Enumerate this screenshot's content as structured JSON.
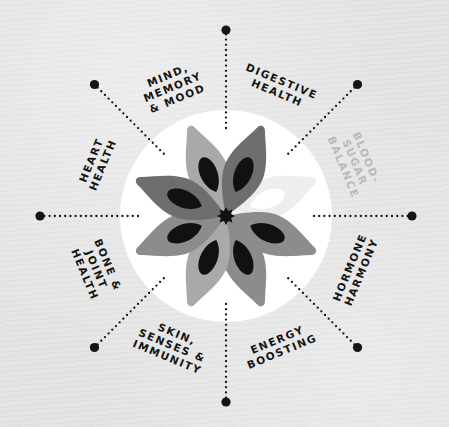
{
  "diagram": {
    "title": "",
    "center": {
      "x": 226,
      "y": 216
    },
    "circle_radius": 106,
    "colors": {
      "background": "#e4e4e4",
      "circle": "#ffffff",
      "ink": "#141414",
      "faded_label": "#b9b9b9",
      "petal_dark": "#6e6e6e",
      "petal_mid": "#8c8c8c",
      "petal_light": "#a9a9a9",
      "petal_faded": "#eeeeee",
      "seed": "#111111"
    },
    "spokes": [
      {
        "id": "mind-memory-mood",
        "angle": -135,
        "label_lines": [
          "MIND,",
          "MEMORY",
          "& MOOD"
        ],
        "faded": false
      },
      {
        "id": "digestive-health",
        "angle": -90,
        "label_lines": [
          "DIGESTIVE",
          "HEALTH"
        ],
        "faded": false
      },
      {
        "id": "blood-sugar-balance",
        "angle": -45,
        "label_lines": [
          "BLOOD-",
          "SUGAR",
          "BALANCE"
        ],
        "faded": true
      },
      {
        "id": "hormone-harmony",
        "angle": 0,
        "label_lines": [
          "HORMONE",
          "HARMONY"
        ],
        "faded": false
      },
      {
        "id": "energy-boosting",
        "angle": 45,
        "label_lines": [
          "ENERGY",
          "BOOSTING"
        ],
        "faded": false
      },
      {
        "id": "skin-senses-immunity",
        "angle": 90,
        "label_lines": [
          "SKIN,",
          "SENSES &",
          "IMMUNITY"
        ],
        "faded": false
      },
      {
        "id": "bone-joint-health",
        "angle": 135,
        "label_lines": [
          "BONE &",
          "JOINT",
          "HEALTH"
        ],
        "faded": false
      },
      {
        "id": "heart-health",
        "angle": 180,
        "label_lines": [
          "HEART",
          "HEALTH"
        ],
        "faded": false
      }
    ],
    "petals": [
      {
        "angle": -112,
        "shade": "petal_light",
        "faded": false
      },
      {
        "angle": -68,
        "shade": "petal_dark",
        "faded": false
      },
      {
        "angle": -22,
        "shade": "petal_faded",
        "faded": true
      },
      {
        "angle": 22,
        "shade": "petal_mid",
        "faded": false
      },
      {
        "angle": 68,
        "shade": "petal_mid",
        "faded": false
      },
      {
        "angle": 112,
        "shade": "petal_light",
        "faded": false
      },
      {
        "angle": 158,
        "shade": "petal_mid",
        "faded": false
      },
      {
        "angle": -158,
        "shade": "petal_dark",
        "faded": false
      }
    ]
  }
}
